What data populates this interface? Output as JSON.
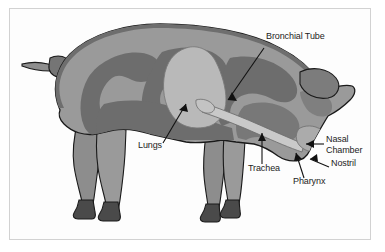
{
  "figure": {
    "view": "lateral side profile, facing right",
    "frame_border_color": "#d2d2d2",
    "background_color": "#ffffff"
  },
  "palette": {
    "outline": "#1a1a1a",
    "body_fill": "#9a9a9a",
    "body_rim": "#6e6e6e",
    "organ_dark": "#6d6d6d",
    "organ_mid": "#878787",
    "lungs_fill": "#b9b9b9",
    "trachea_fill": "#c9c9c9",
    "hoof_fill": "#4a4a4a",
    "leg_fill": "#8d8d8d",
    "label_text": "#1c1c1c",
    "leader_line": "#111111"
  },
  "labels": [
    {
      "id": "bronchial-tube",
      "text": "Bronchial Tube",
      "x": 266,
      "y": 36,
      "leader": {
        "from_x": 264,
        "from_y": 48,
        "to_x": 228,
        "to_y": 100
      },
      "arrow": true
    },
    {
      "id": "lungs",
      "text": "Lungs",
      "x": 138,
      "y": 145,
      "leader": {
        "from_x": 163,
        "from_y": 143,
        "to_x": 186,
        "to_y": 104
      },
      "arrow": true
    },
    {
      "id": "trachea",
      "text": "Trachea",
      "x": 248,
      "y": 168,
      "leader": {
        "from_x": 262,
        "from_y": 164,
        "to_x": 262,
        "to_y": 133
      },
      "arrow": true
    },
    {
      "id": "nasal-chamber",
      "text": "Nasal\nChamber",
      "x": 326,
      "y": 139,
      "leader": {
        "from_x": 324,
        "from_y": 144,
        "to_x": 306,
        "to_y": 144
      },
      "arrow": true
    },
    {
      "id": "nostril",
      "text": "Nostril",
      "x": 331,
      "y": 163,
      "leader": {
        "from_x": 329,
        "from_y": 167,
        "to_x": 310,
        "to_y": 159
      },
      "arrow": true
    },
    {
      "id": "pharynx",
      "text": "Pharynx",
      "x": 293,
      "y": 181,
      "leader": {
        "from_x": 304,
        "from_y": 178,
        "to_x": 296,
        "to_y": 153
      },
      "arrow": true
    }
  ],
  "anatomy_parts": [
    {
      "id": "lungs",
      "name": "Lungs",
      "shade": "light"
    },
    {
      "id": "bronchial-tube",
      "name": "Bronchial Tube",
      "shade": "light"
    },
    {
      "id": "trachea",
      "name": "Trachea",
      "shade": "light"
    },
    {
      "id": "pharynx",
      "name": "Pharynx",
      "shade": "light"
    },
    {
      "id": "nasal-chamber",
      "name": "Nasal Chamber",
      "shade": "light"
    },
    {
      "id": "nostril",
      "name": "Nostril",
      "shade": "dark"
    }
  ]
}
